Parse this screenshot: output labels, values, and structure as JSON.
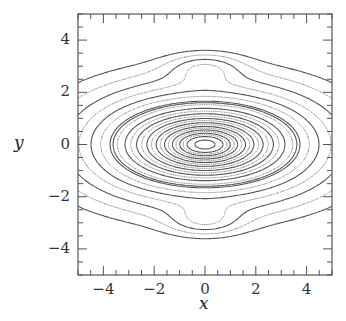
{
  "chart_data": {
    "type": "contour",
    "title": "",
    "xlabel": "x",
    "ylabel": "y",
    "xlim": [
      -5,
      5
    ],
    "ylim": [
      -5,
      5
    ],
    "x_ticks": [
      -4,
      -2,
      0,
      2,
      4
    ],
    "y_ticks": [
      -4,
      -2,
      0,
      2,
      4
    ],
    "x_tick_labels": [
      "−4",
      "−2",
      "0",
      "2",
      "4"
    ],
    "y_tick_labels": [
      "−4",
      "−2",
      "0",
      "2",
      "4"
    ],
    "minor_tick_step": 0.5,
    "grid": false,
    "legend": null,
    "line_styles": {
      "solid": "contour level set A",
      "dotted": "contour level set B"
    },
    "features": {
      "central_minimum": [
        0,
        0
      ],
      "secondary_closed_contours": [
        [
          0,
          3.0
        ],
        [
          0,
          -3.0
        ]
      ],
      "central_nested_ellipses": {
        "count_solid_approx": 9,
        "semi_axis_ratio_x_to_y": 2.3
      },
      "open_contours_in_corners": true
    }
  },
  "axis": {
    "x_label": "x",
    "y_label": "y"
  }
}
